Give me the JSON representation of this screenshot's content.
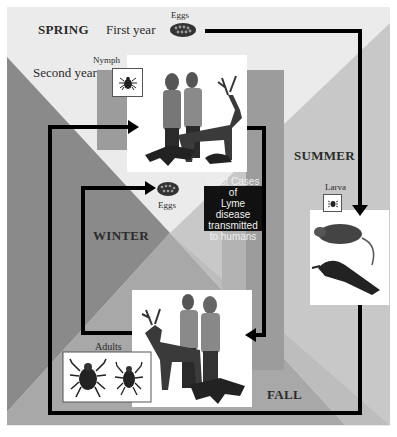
{
  "colors": {
    "spring_bg": "#ebebeb",
    "summer_bg": "#c8c8c8",
    "fall_bg": "#a8a8a8",
    "winter_bg": "#8a8a8a",
    "band": "#9c9c9c",
    "arrow": "#000000",
    "callout_bg": "#111111"
  },
  "seasons": {
    "spring": "SPRING",
    "summer": "SUMMER",
    "fall": "FALL",
    "winter": "WINTER"
  },
  "years": {
    "first": "First year",
    "second": "Second year"
  },
  "stages": {
    "eggs_top": "Eggs",
    "eggs_mid": "Eggs",
    "nymph": "Nymph",
    "larva": "Larva",
    "adults": "Adults"
  },
  "callout": {
    "line1": "Most Cases of",
    "line2": "Lyme disease",
    "line3": "transmitted",
    "line4": "to humans"
  },
  "hosts": {
    "nymph_hosts": [
      "humans",
      "deer",
      "fox",
      "chipmunk"
    ],
    "larva_hosts": [
      "mouse",
      "bird"
    ],
    "adult_hosts": [
      "deer",
      "humans",
      "fox"
    ]
  }
}
